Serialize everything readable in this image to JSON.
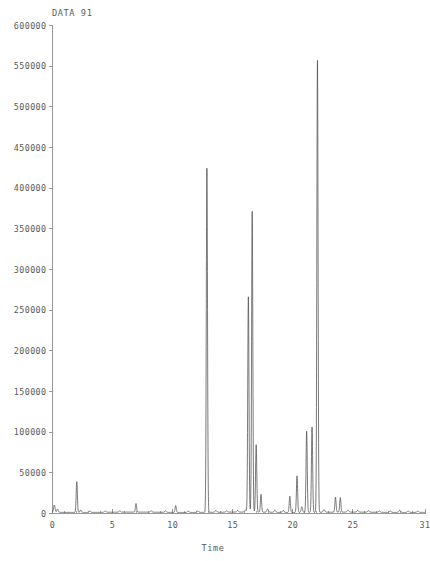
{
  "chart_data": {
    "type": "line",
    "title": "DATA 91",
    "xlabel": "Time",
    "ylabel": "",
    "xlim": [
      0,
      31
    ],
    "ylim": [
      0,
      600000
    ],
    "grid": false,
    "legend": false,
    "x_major_ticks": [
      0,
      5,
      10,
      15,
      20,
      25,
      31
    ],
    "x_major_tick_labels": [
      "0",
      "5",
      "10",
      "15",
      "20",
      "25",
      "31"
    ],
    "x_minor_tick_step": 1,
    "y_ticks": [
      0,
      50000,
      100000,
      150000,
      200000,
      250000,
      300000,
      350000,
      400000,
      450000,
      500000,
      550000,
      600000
    ],
    "y_tick_labels": [
      "0",
      "50000",
      "100000",
      "150000",
      "200000",
      "250000",
      "300000",
      "350000",
      "400000",
      "450000",
      "500000",
      "550000",
      "600000"
    ],
    "series_name": "DATA 91",
    "trace_color": "#4d4d4d",
    "axis_color": "#8d8d8d",
    "baseline": 1500,
    "peaks": [
      {
        "time": 0.15,
        "height": 9000,
        "width": 0.06
      },
      {
        "time": 0.42,
        "height": 4000,
        "width": 0.06
      },
      {
        "time": 2.02,
        "height": 38000,
        "width": 0.05
      },
      {
        "time": 2.35,
        "height": 3000,
        "width": 0.06
      },
      {
        "time": 3.1,
        "height": 1800,
        "width": 0.07
      },
      {
        "time": 4.4,
        "height": 1600,
        "width": 0.07
      },
      {
        "time": 5.6,
        "height": 1500,
        "width": 0.07
      },
      {
        "time": 6.95,
        "height": 10500,
        "width": 0.05
      },
      {
        "time": 8.2,
        "height": 1600,
        "width": 0.07
      },
      {
        "time": 9.4,
        "height": 1800,
        "width": 0.07
      },
      {
        "time": 10.25,
        "height": 8500,
        "width": 0.05
      },
      {
        "time": 11.3,
        "height": 1700,
        "width": 0.07
      },
      {
        "time": 12.1,
        "height": 2000,
        "width": 0.07
      },
      {
        "time": 12.85,
        "height": 424000,
        "width": 0.05
      },
      {
        "time": 13.6,
        "height": 2200,
        "width": 0.07
      },
      {
        "time": 14.5,
        "height": 1800,
        "width": 0.07
      },
      {
        "time": 15.4,
        "height": 2000,
        "width": 0.07
      },
      {
        "time": 16.05,
        "height": 2600,
        "width": 0.07
      },
      {
        "time": 16.3,
        "height": 265000,
        "width": 0.05
      },
      {
        "time": 16.62,
        "height": 370000,
        "width": 0.05
      },
      {
        "time": 16.95,
        "height": 83000,
        "width": 0.05
      },
      {
        "time": 17.35,
        "height": 22000,
        "width": 0.05
      },
      {
        "time": 17.9,
        "height": 4000,
        "width": 0.07
      },
      {
        "time": 18.5,
        "height": 2600,
        "width": 0.07
      },
      {
        "time": 19.2,
        "height": 2400,
        "width": 0.07
      },
      {
        "time": 19.75,
        "height": 20000,
        "width": 0.05
      },
      {
        "time": 20.35,
        "height": 45000,
        "width": 0.05
      },
      {
        "time": 20.75,
        "height": 7000,
        "width": 0.06
      },
      {
        "time": 21.15,
        "height": 100000,
        "width": 0.05
      },
      {
        "time": 21.6,
        "height": 105000,
        "width": 0.05
      },
      {
        "time": 22.05,
        "height": 557000,
        "width": 0.05
      },
      {
        "time": 22.6,
        "height": 3200,
        "width": 0.07
      },
      {
        "time": 23.55,
        "height": 18500,
        "width": 0.05
      },
      {
        "time": 23.95,
        "height": 18000,
        "width": 0.05
      },
      {
        "time": 24.6,
        "height": 2400,
        "width": 0.07
      },
      {
        "time": 25.4,
        "height": 2000,
        "width": 0.07
      },
      {
        "time": 26.3,
        "height": 1800,
        "width": 0.07
      },
      {
        "time": 27.2,
        "height": 1700,
        "width": 0.07
      },
      {
        "time": 28.1,
        "height": 1900,
        "width": 0.07
      },
      {
        "time": 28.9,
        "height": 2600,
        "width": 0.07
      },
      {
        "time": 29.6,
        "height": 1800,
        "width": 0.07
      },
      {
        "time": 30.4,
        "height": 1600,
        "width": 0.07
      }
    ]
  }
}
